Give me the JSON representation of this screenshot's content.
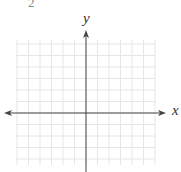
{
  "problem": {
    "number": "2"
  },
  "graph": {
    "x_label": "x",
    "y_label": "y",
    "grid": {
      "left": 16,
      "right": 155,
      "top": 40,
      "bottom": 165,
      "cell": 11.5,
      "color": "#e6e6e6"
    },
    "axis": {
      "origin_x": 86,
      "origin_y": 113,
      "x_start": 4,
      "x_end": 166,
      "y_start": 30,
      "y_end": 172,
      "color": "#444444"
    }
  }
}
